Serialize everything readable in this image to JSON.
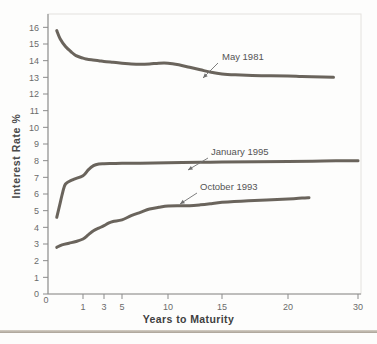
{
  "chart_data": {
    "type": "line",
    "title": "",
    "xlabel": "Years to Maturity",
    "ylabel": "Interest Rate %",
    "xticks": [
      0,
      1,
      3,
      5,
      10,
      15,
      20,
      30
    ],
    "xtick_labels": [
      "0",
      "1",
      "3",
      "5",
      "10",
      "15",
      "20",
      "30"
    ],
    "yticks": [
      0,
      1,
      2,
      3,
      4,
      5,
      6,
      7,
      8,
      9,
      10,
      11,
      12,
      13,
      14,
      15,
      16
    ],
    "ytick_labels": [
      "0",
      "1",
      "2",
      "3",
      "4",
      "5",
      "6",
      "7",
      "8",
      "9",
      "10",
      "11",
      "12",
      "13",
      "14",
      "15",
      "16"
    ],
    "xlim": [
      0,
      30
    ],
    "ylim": [
      0,
      16.8
    ],
    "x_scale": "compressed-nonlinear",
    "grid": false,
    "legend": "inline-annotations",
    "series": [
      {
        "name": "May 1981",
        "label": "May 1981",
        "color": "#5d574e",
        "points": [
          [
            0.25,
            15.8
          ],
          [
            0.35,
            15.3
          ],
          [
            0.5,
            14.85
          ],
          [
            0.65,
            14.55
          ],
          [
            0.8,
            14.3
          ],
          [
            1.0,
            14.15
          ],
          [
            1.3,
            14.1
          ],
          [
            1.8,
            14.05
          ],
          [
            2.5,
            14.0
          ],
          [
            3.0,
            13.95
          ],
          [
            4.0,
            13.9
          ],
          [
            5.0,
            13.85
          ],
          [
            6.0,
            13.8
          ],
          [
            7.0,
            13.78
          ],
          [
            8.0,
            13.8
          ],
          [
            9.0,
            13.85
          ],
          [
            10.0,
            13.85
          ],
          [
            11.0,
            13.75
          ],
          [
            12.0,
            13.6
          ],
          [
            13.0,
            13.45
          ],
          [
            14.0,
            13.3
          ],
          [
            15.0,
            13.2
          ],
          [
            16.0,
            13.15
          ],
          [
            18.0,
            13.1
          ],
          [
            20.0,
            13.08
          ],
          [
            22.0,
            13.05
          ],
          [
            25.0,
            13.02
          ],
          [
            26.5,
            13.0
          ]
        ]
      },
      {
        "name": "January 1995",
        "label": "January 1995",
        "color": "#5d574e",
        "points": [
          [
            0.25,
            4.6
          ],
          [
            0.33,
            5.3
          ],
          [
            0.42,
            6.1
          ],
          [
            0.5,
            6.6
          ],
          [
            0.7,
            6.85
          ],
          [
            1.0,
            7.1
          ],
          [
            1.5,
            7.45
          ],
          [
            2.0,
            7.7
          ],
          [
            2.5,
            7.8
          ],
          [
            3.0,
            7.82
          ],
          [
            4.0,
            7.83
          ],
          [
            5.0,
            7.84
          ],
          [
            7.0,
            7.85
          ],
          [
            10.0,
            7.87
          ],
          [
            13.0,
            7.9
          ],
          [
            15.0,
            7.92
          ],
          [
            20.0,
            7.95
          ],
          [
            25.0,
            7.98
          ],
          [
            30.0,
            8.0
          ]
        ]
      },
      {
        "name": "October 1993",
        "label": "October 1993",
        "color": "#5d574e",
        "points": [
          [
            0.25,
            2.8
          ],
          [
            0.4,
            2.95
          ],
          [
            0.6,
            3.05
          ],
          [
            0.8,
            3.15
          ],
          [
            1.0,
            3.3
          ],
          [
            1.5,
            3.55
          ],
          [
            2.0,
            3.8
          ],
          [
            2.5,
            3.95
          ],
          [
            3.0,
            4.1
          ],
          [
            3.5,
            4.25
          ],
          [
            4.0,
            4.35
          ],
          [
            5.0,
            4.45
          ],
          [
            6.0,
            4.7
          ],
          [
            7.0,
            4.9
          ],
          [
            8.0,
            5.1
          ],
          [
            9.0,
            5.2
          ],
          [
            10.0,
            5.28
          ],
          [
            11.0,
            5.3
          ],
          [
            12.0,
            5.3
          ],
          [
            13.0,
            5.35
          ],
          [
            14.0,
            5.42
          ],
          [
            15.0,
            5.5
          ],
          [
            17.0,
            5.6
          ],
          [
            20.0,
            5.7
          ],
          [
            22.0,
            5.76
          ],
          [
            23.0,
            5.78
          ]
        ]
      }
    ],
    "annotations": [
      {
        "text": "May 1981",
        "text_x": 222,
        "text_y": 60,
        "leader_from_x": 218,
        "leader_from_y": 63,
        "leader_to_x": 203,
        "leader_to_y": 78
      },
      {
        "text": "January 1995",
        "text_x": 211,
        "text_y": 155,
        "leader_from_x": 208,
        "leader_from_y": 158,
        "leader_to_x": 188,
        "leader_to_y": 170
      },
      {
        "text": "October 1993",
        "text_x": 200,
        "text_y": 190,
        "leader_from_x": 197,
        "leader_from_y": 193,
        "leader_to_x": 180,
        "leader_to_y": 204
      }
    ]
  }
}
